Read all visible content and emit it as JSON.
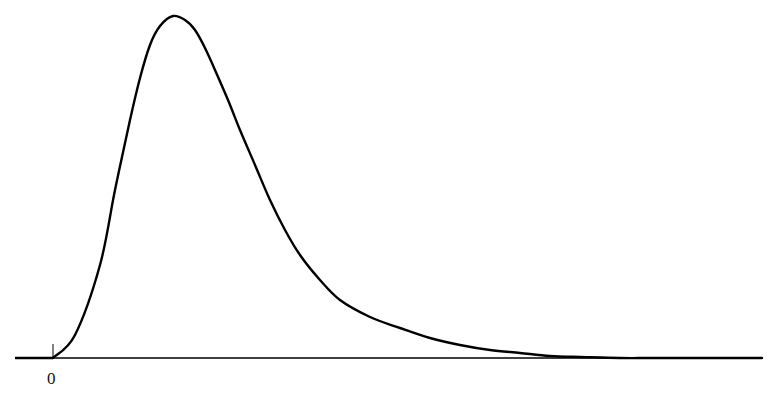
{
  "chart_data": {
    "type": "line",
    "title": "",
    "xlabel": "",
    "ylabel": "",
    "x_tick_labels": [
      "0"
    ],
    "grid": false,
    "legend": null,
    "line_color": "#000000",
    "points_px": [
      [
        53,
        358
      ],
      [
        75,
        335
      ],
      [
        100,
        265
      ],
      [
        115,
        190
      ],
      [
        130,
        120
      ],
      [
        140,
        78
      ],
      [
        150,
        45
      ],
      [
        160,
        26
      ],
      [
        173,
        16
      ],
      [
        185,
        20
      ],
      [
        195,
        30
      ],
      [
        205,
        48
      ],
      [
        215,
        70
      ],
      [
        228,
        100
      ],
      [
        240,
        130
      ],
      [
        255,
        165
      ],
      [
        270,
        200
      ],
      [
        285,
        230
      ],
      [
        300,
        255
      ],
      [
        320,
        280
      ],
      [
        340,
        300
      ],
      [
        370,
        317
      ],
      [
        400,
        328
      ],
      [
        430,
        338
      ],
      [
        460,
        345
      ],
      [
        490,
        350
      ],
      [
        520,
        353
      ],
      [
        550,
        356
      ],
      [
        580,
        357
      ],
      [
        620,
        358
      ],
      [
        660,
        358
      ],
      [
        762,
        358
      ]
    ],
    "baseline_y_px": 358,
    "x_range_px": [
      15,
      762
    ],
    "origin_x_px": 53
  },
  "axis": {
    "origin_label": "0"
  }
}
